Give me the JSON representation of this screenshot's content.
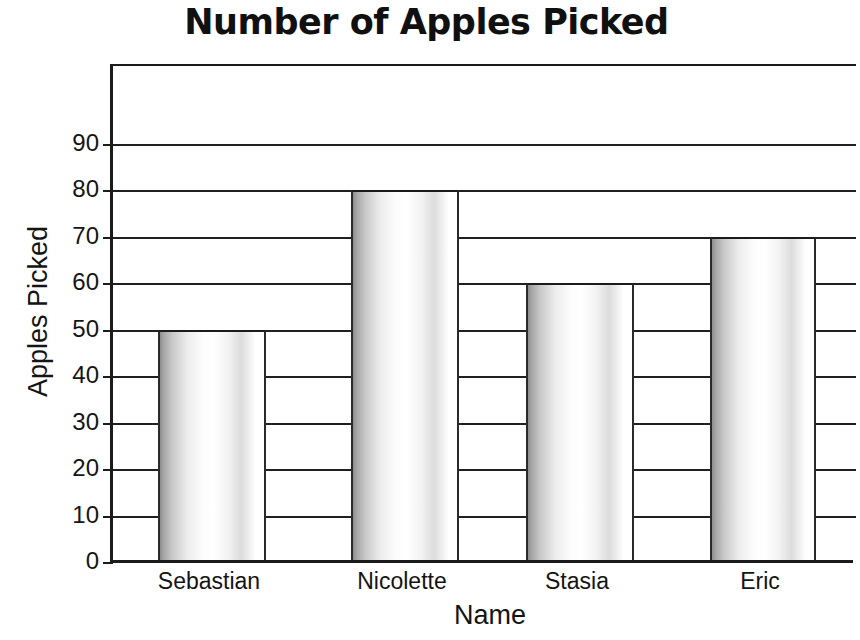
{
  "chart_data": {
    "type": "bar",
    "title": "Number of Apples Picked",
    "xlabel": "Name",
    "ylabel": "Apples Picked",
    "categories": [
      "Sebastian",
      "Nicolette",
      "Stasia",
      "Eric"
    ],
    "values": [
      50,
      80,
      60,
      70
    ],
    "series": [
      {
        "name": "Apples Picked",
        "values": [
          50,
          80,
          60,
          70
        ]
      }
    ],
    "ylim": [
      0,
      100
    ],
    "ytick_labels": [
      "90",
      "80",
      "70",
      "60",
      "50",
      "40",
      "30",
      "20",
      "10",
      "0"
    ],
    "ytick_values": [
      90,
      80,
      70,
      60,
      50,
      40,
      30,
      20,
      10,
      0
    ],
    "ytick_step": 10,
    "grid": true,
    "grid_axis": "y",
    "legend": false,
    "legend_position": "none",
    "bar_style": "cylinder-gradient",
    "colors": {
      "axis": "#1b1b1b",
      "grid": "#202020",
      "bar_edge": "#2a2a2a",
      "bar_fill_light": "#ffffff",
      "bar_fill_dark": "#8e8e8e",
      "text": "#141414",
      "background": "#ffffff"
    }
  }
}
